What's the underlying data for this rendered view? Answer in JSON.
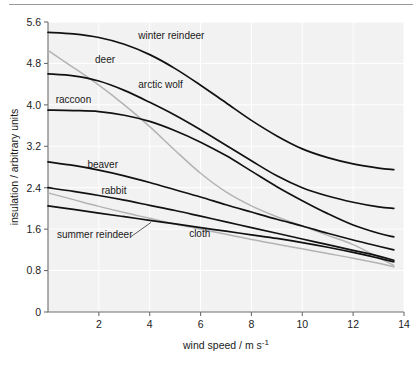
{
  "figure": {
    "top_rule": true,
    "background_color": "#ffffff",
    "plot_background_color": "#f2f2f2",
    "gridline_color": "#ffffff",
    "axis_color": "#6e6e6e"
  },
  "chart_data": {
    "type": "line",
    "title": "",
    "xlabel": "wind speed / m s⁻¹",
    "ylabel": "insulation / arbitrary units",
    "xlim": [
      0,
      14
    ],
    "ylim": [
      0,
      5.6
    ],
    "xticks": [
      0,
      2,
      4,
      6,
      8,
      10,
      12,
      14
    ],
    "xtick_labels": [
      "",
      "2",
      "4",
      "6",
      "8",
      "10",
      "12",
      "14"
    ],
    "yticks": [
      0,
      0.8,
      1.6,
      2.4,
      3.2,
      4.0,
      4.8,
      5.6
    ],
    "ytick_labels": [
      "0",
      "0.8",
      "1.6",
      "2.4",
      "3.2",
      "4.0",
      "4.8",
      "5.6"
    ],
    "grid": true,
    "legend": "inline-labels",
    "x": [
      0,
      1,
      2,
      3,
      4,
      5,
      6,
      7,
      8,
      9,
      10,
      11,
      12,
      13,
      13.6
    ],
    "series": [
      {
        "name": "winter reindeer",
        "color": "#111111",
        "label_x": 3.55,
        "label_y": 5.28,
        "values": [
          5.4,
          5.37,
          5.3,
          5.17,
          4.97,
          4.7,
          4.38,
          4.04,
          3.7,
          3.4,
          3.15,
          2.98,
          2.86,
          2.78,
          2.75
        ]
      },
      {
        "name": "deer",
        "color": "#b3b3b3",
        "label_x": 1.85,
        "label_y": 4.8,
        "values": [
          5.05,
          4.72,
          4.38,
          4.0,
          3.58,
          3.12,
          2.68,
          2.32,
          2.05,
          1.84,
          1.66,
          1.48,
          1.3,
          1.05,
          0.9
        ]
      },
      {
        "name": "arctic wolf",
        "color": "#111111",
        "label_x": 3.55,
        "label_y": 4.32,
        "values": [
          4.6,
          4.56,
          4.46,
          4.28,
          4.05,
          3.8,
          3.52,
          3.22,
          2.92,
          2.63,
          2.4,
          2.24,
          2.12,
          2.03,
          2.0
        ]
      },
      {
        "name": "raccoon",
        "color": "#111111",
        "label_x": 0.3,
        "label_y": 4.03,
        "values": [
          3.9,
          3.89,
          3.87,
          3.8,
          3.68,
          3.5,
          3.28,
          3.02,
          2.72,
          2.42,
          2.15,
          1.9,
          1.68,
          1.52,
          1.45
        ]
      },
      {
        "name": "beaver",
        "color": "#111111",
        "label_x": 1.55,
        "label_y": 2.78,
        "values": [
          2.9,
          2.83,
          2.74,
          2.63,
          2.5,
          2.36,
          2.22,
          2.07,
          1.93,
          1.79,
          1.66,
          1.52,
          1.39,
          1.27,
          1.2
        ]
      },
      {
        "name": "rabbit",
        "color": "#111111",
        "label_x": 2.1,
        "label_y": 2.28,
        "values": [
          2.4,
          2.33,
          2.25,
          2.16,
          2.06,
          1.96,
          1.85,
          1.74,
          1.63,
          1.52,
          1.41,
          1.3,
          1.19,
          1.08,
          1.0
        ]
      },
      {
        "name": "cloth",
        "color": "#b3b3b3",
        "label_x": 5.55,
        "label_y": 1.44,
        "values": [
          2.3,
          2.17,
          2.04,
          1.92,
          1.81,
          1.7,
          1.6,
          1.5,
          1.4,
          1.31,
          1.22,
          1.13,
          1.04,
          0.94,
          0.87
        ]
      },
      {
        "name": "summer reindeer",
        "color": "#111111",
        "label_x": 0.35,
        "label_y": 1.42,
        "values": [
          2.05,
          1.98,
          1.91,
          1.84,
          1.77,
          1.7,
          1.63,
          1.56,
          1.49,
          1.42,
          1.34,
          1.25,
          1.15,
          1.04,
          0.97
        ]
      }
    ],
    "leader_lines": [
      {
        "from_name": "summer-reindeer-label",
        "x1": 3.25,
        "y1": 1.45,
        "x2": 4.05,
        "y2": 1.73
      }
    ]
  }
}
